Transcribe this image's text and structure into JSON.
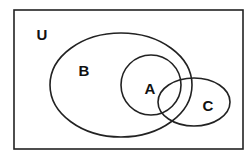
{
  "diagram": {
    "type": "venn",
    "universe_label": "U",
    "sets": [
      {
        "label": "B"
      },
      {
        "label": "A",
        "note": "subset region mostly inside B"
      },
      {
        "label": "C"
      }
    ],
    "colors": {
      "stroke": "#222222",
      "background": "#ffffff"
    }
  }
}
